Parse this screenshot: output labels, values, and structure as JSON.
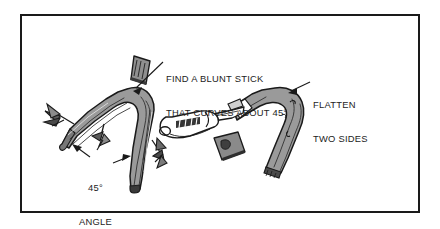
{
  "figure": {
    "type": "instructional-line-drawing",
    "frame": {
      "border_color": "#1a1a1a"
    },
    "background": "#ffffff"
  },
  "labels": {
    "find_stick": {
      "line1": "FIND A BLUNT STICK",
      "line2": "THAT CURVES ABOUT 45°"
    },
    "flatten": {
      "line1": "FLATTEN",
      "line2": "TWO SIDES"
    },
    "angle": {
      "line1": "45°",
      "line2": "ANGLE"
    }
  },
  "illustrations": {
    "left": {
      "name": "curved-stick-with-twigs",
      "fill": "#9a9a9a",
      "outline": "#1a1a1a"
    },
    "right": {
      "name": "pocket-knife-flattening-stick",
      "stick_fill": "#9a9a9a",
      "knife_fill": "#ffffff",
      "outline": "#1a1a1a"
    },
    "detail": {
      "name": "flattened-end-detail",
      "fill": "#8f8f8f"
    }
  },
  "arrows": {
    "find_stick_arrow": "points down-left to stick bend",
    "flatten_arrow": "points left to flattened stick face",
    "angle_arrow_left": "points up-left to lower stick arm",
    "angle_arrow_right": "points up-right to stick bend"
  }
}
